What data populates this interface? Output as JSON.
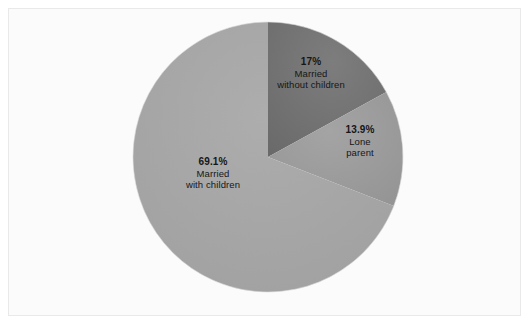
{
  "chart_data": {
    "type": "pie",
    "title": "",
    "subtitle": "",
    "xlabel": "",
    "ylabel": "",
    "grid": false,
    "legend": "none",
    "labels_position": "inside-slices",
    "start_angle_deg": 0,
    "direction": "clockwise",
    "center": {
      "x": 268,
      "y": 157
    },
    "radius": 135,
    "categories": [
      "Married without children",
      "Lone parent",
      "Married with children"
    ],
    "values": [
      17,
      13.9,
      69.1
    ],
    "value_labels": [
      "17%",
      "13.9%",
      "69.1%"
    ],
    "colors": [
      "#727272",
      "#9a9a9a",
      "#a6a6a6"
    ],
    "slices": [
      {
        "name": "married-without-children",
        "percent": 17,
        "percent_label": "17%",
        "description_line1": "Married",
        "description_line2": "without children",
        "color": "#727272",
        "sweep_deg": 61.2,
        "start_deg": 0,
        "end_deg": 61.2
      },
      {
        "name": "lone-parent",
        "percent": 13.9,
        "percent_label": "13.9%",
        "description_line1": "Lone",
        "description_line2": "parent",
        "color": "#9a9a9a",
        "sweep_deg": 50.04,
        "start_deg": 61.2,
        "end_deg": 111.24
      },
      {
        "name": "married-with-children",
        "percent": 69.1,
        "percent_label": "69.1%",
        "description_line1": "Married",
        "description_line2": "with children",
        "color": "#a6a6a6",
        "sweep_deg": 248.76,
        "start_deg": 111.24,
        "end_deg": 360
      }
    ]
  },
  "figure": {
    "background_color": "#fbfbfb",
    "frame_color": "#e9e9e9",
    "page_background": "#ffffff"
  },
  "labels": {
    "married_without_children": {
      "pct": "17%",
      "line1": "Married",
      "line2": "without children"
    },
    "lone_parent": {
      "pct": "13.9%",
      "line1": "Lone",
      "line2": "parent"
    },
    "married_with_children": {
      "pct": "69.1%",
      "line1": "Married",
      "line2": "with children"
    }
  }
}
